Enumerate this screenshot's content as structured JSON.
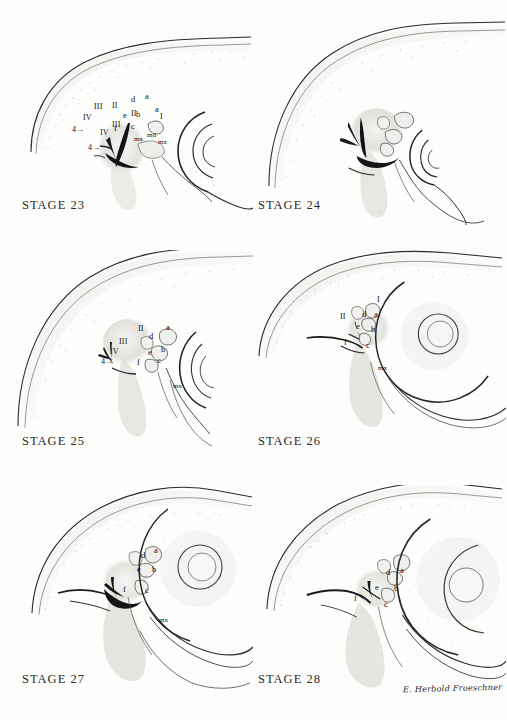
{
  "plate": {
    "title": "Embryonic head development stages 23-28",
    "background_color": "#fdfdfc",
    "ink_color": "#1a1a1a",
    "signature": "E. Herbold Froeschner"
  },
  "panels": [
    {
      "id": "stage-23",
      "stage_label": "STAGE 23",
      "labels": [
        {
          "key": "arch4",
          "text": "4→",
          "x": 88,
          "y": 144
        },
        {
          "key": "IV",
          "text": "IV",
          "x": 100,
          "y": 129
        },
        {
          "key": "III",
          "text": "III",
          "x": 112,
          "y": 121
        },
        {
          "key": "II",
          "text": "II",
          "x": 131,
          "y": 110
        },
        {
          "key": "a",
          "text": "a",
          "x": 155,
          "y": 105
        },
        {
          "key": "I",
          "text": "I",
          "x": 160,
          "y": 113
        },
        {
          "key": "md",
          "text": "md",
          "x": 147,
          "y": 132
        },
        {
          "key": "mx",
          "text": "mx",
          "x": 158,
          "y": 139
        }
      ]
    },
    {
      "id": "stage-24",
      "stage_label": "STAGE 24",
      "labels": [
        {
          "key": "arch4",
          "text": "4→",
          "x": 72,
          "y": 126
        },
        {
          "key": "IV",
          "text": "IV",
          "x": 83,
          "y": 114
        },
        {
          "key": "III",
          "text": "III",
          "x": 94,
          "y": 103
        },
        {
          "key": "II",
          "text": "II",
          "x": 112,
          "y": 102
        },
        {
          "key": "d",
          "text": "d",
          "x": 131,
          "y": 95
        },
        {
          "key": "a",
          "text": "a",
          "x": 145,
          "y": 92
        },
        {
          "key": "e",
          "text": "e",
          "x": 123,
          "y": 111
        },
        {
          "key": "b",
          "text": "b",
          "x": 136,
          "y": 110
        },
        {
          "key": "f",
          "text": "f",
          "x": 114,
          "y": 124
        },
        {
          "key": "c",
          "text": "c",
          "x": 131,
          "y": 122
        },
        {
          "key": "mx",
          "text": "mx",
          "x": 134,
          "y": 136
        }
      ]
    },
    {
      "id": "stage-25",
      "stage_label": "STAGE 25",
      "labels": [
        {
          "key": "arch4",
          "text": "4→",
          "x": 101,
          "y": 358
        },
        {
          "key": "IV",
          "text": "IV",
          "x": 110,
          "y": 348
        },
        {
          "key": "III",
          "text": "III",
          "x": 119,
          "y": 338
        },
        {
          "key": "II",
          "text": "II",
          "x": 138,
          "y": 325
        },
        {
          "key": "d",
          "text": "d",
          "x": 149,
          "y": 332
        },
        {
          "key": "a",
          "text": "a",
          "x": 166,
          "y": 323
        },
        {
          "key": "e",
          "text": "e",
          "x": 148,
          "y": 348
        },
        {
          "key": "b",
          "text": "b",
          "x": 161,
          "y": 345
        },
        {
          "key": "f",
          "text": "f",
          "x": 137,
          "y": 358
        },
        {
          "key": "c",
          "text": "c",
          "x": 157,
          "y": 356
        },
        {
          "key": "mx",
          "text": "mx",
          "x": 173,
          "y": 383
        }
      ]
    },
    {
      "id": "stage-26",
      "stage_label": "STAGE 26",
      "labels": [
        {
          "key": "I",
          "text": "I",
          "x": 377,
          "y": 296
        },
        {
          "key": "II",
          "text": "II",
          "x": 340,
          "y": 313
        },
        {
          "key": "d",
          "text": "d",
          "x": 362,
          "y": 310
        },
        {
          "key": "a",
          "text": "a",
          "x": 374,
          "y": 310
        },
        {
          "key": "e",
          "text": "e",
          "x": 356,
          "y": 322
        },
        {
          "key": "b",
          "text": "b",
          "x": 371,
          "y": 325
        },
        {
          "key": "f",
          "text": "f",
          "x": 344,
          "y": 338
        },
        {
          "key": "c",
          "text": "c",
          "x": 366,
          "y": 341
        },
        {
          "key": "mx",
          "text": "mx",
          "x": 378,
          "y": 365
        }
      ]
    },
    {
      "id": "stage-27",
      "stage_label": "STAGE 27",
      "labels": [
        {
          "key": "d",
          "text": "d",
          "x": 141,
          "y": 551
        },
        {
          "key": "a",
          "text": "a",
          "x": 154,
          "y": 546
        },
        {
          "key": "e",
          "text": "e",
          "x": 137,
          "y": 565
        },
        {
          "key": "b",
          "text": "b",
          "x": 152,
          "y": 565
        },
        {
          "key": "f",
          "text": "f",
          "x": 123,
          "y": 585
        },
        {
          "key": "c",
          "text": "c",
          "x": 145,
          "y": 586
        },
        {
          "key": "mx",
          "text": "mx",
          "x": 159,
          "y": 617
        }
      ]
    },
    {
      "id": "stage-28",
      "stage_label": "STAGE 28",
      "labels": [
        {
          "key": "d",
          "text": "d",
          "x": 386,
          "y": 568
        },
        {
          "key": "a",
          "text": "a",
          "x": 400,
          "y": 566
        },
        {
          "key": "e",
          "text": "e",
          "x": 375,
          "y": 583
        },
        {
          "key": "b",
          "text": "b",
          "x": 394,
          "y": 584
        },
        {
          "key": "f",
          "text": "f",
          "x": 354,
          "y": 594
        },
        {
          "key": "c",
          "text": "c",
          "x": 384,
          "y": 600
        }
      ]
    }
  ],
  "stage_label_positions": [
    {
      "id": "stage-23",
      "x": 22,
      "y": 198
    },
    {
      "id": "stage-24",
      "x": 258,
      "y": 198
    },
    {
      "id": "stage-25",
      "x": 22,
      "y": 434
    },
    {
      "id": "stage-26",
      "x": 258,
      "y": 434
    },
    {
      "id": "stage-27",
      "x": 22,
      "y": 672
    },
    {
      "id": "stage-28",
      "x": 258,
      "y": 672
    }
  ],
  "signature_position": {
    "x": 403,
    "y": 684
  }
}
